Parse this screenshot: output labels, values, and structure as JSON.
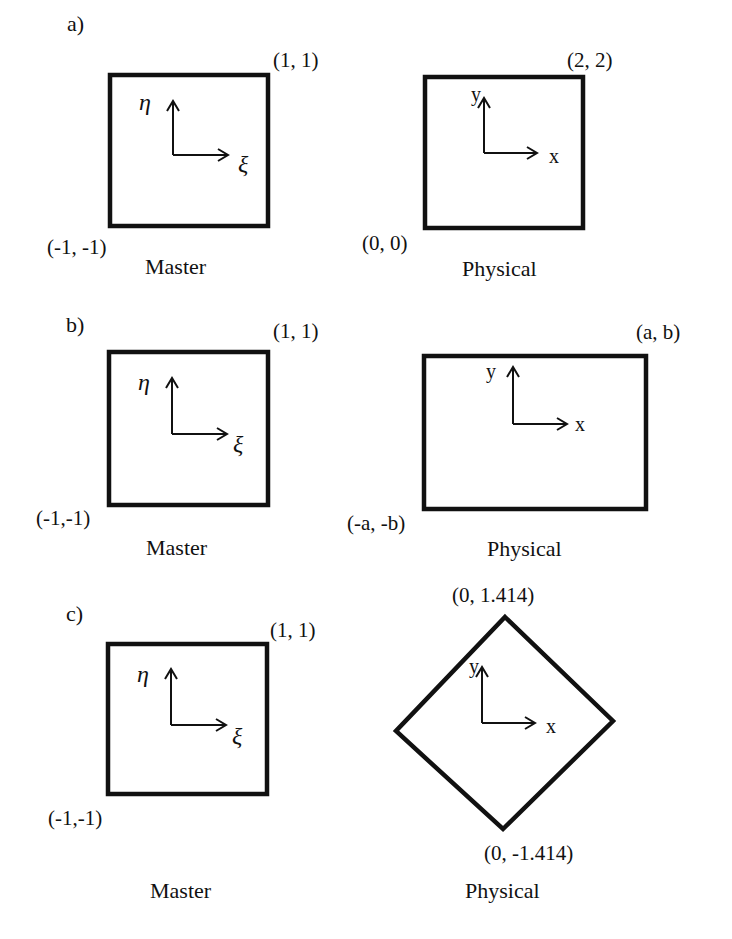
{
  "figure": {
    "panels": [
      {
        "tag": "a)",
        "master": {
          "caption": "Master",
          "corner_top_right": "(1, 1)",
          "corner_bottom_left": "(-1, -1)",
          "axis_up": "η",
          "axis_right": "ξ"
        },
        "physical": {
          "caption": "Physical",
          "shape": "square",
          "corner_top_right": "(2, 2)",
          "corner_bottom_left": "(0, 0)",
          "axis_up": "y",
          "axis_right": "x"
        }
      },
      {
        "tag": "b)",
        "master": {
          "caption": "Master",
          "corner_top_right": "(1, 1)",
          "corner_bottom_left": "(-1,-1)",
          "axis_up": "η",
          "axis_right": "ξ"
        },
        "physical": {
          "caption": "Physical",
          "shape": "rectangle",
          "corner_top_right": "(a, b)",
          "corner_bottom_left": "(-a, -b)",
          "axis_up": "y",
          "axis_right": "x"
        }
      },
      {
        "tag": "c)",
        "master": {
          "caption": "Master",
          "corner_top_right": "(1, 1)",
          "corner_bottom_left": "(-1,-1)",
          "axis_up": "η",
          "axis_right": "ξ"
        },
        "physical": {
          "caption": "Physical",
          "shape": "diamond",
          "corner_top": "(0, 1.414)",
          "corner_bottom": "(0, -1.414)",
          "axis_up": "y",
          "axis_right": "x"
        }
      }
    ],
    "colors": {
      "stroke": "#111111",
      "background": "#ffffff"
    }
  }
}
